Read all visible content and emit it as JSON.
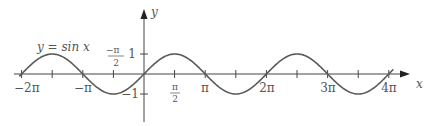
{
  "chart_data": {
    "type": "line",
    "title": "",
    "function_label": "y = sin x",
    "xlabel": "x",
    "ylabel": "y",
    "xlim": [
      -6.54,
      13.2
    ],
    "ylim": [
      -1.8,
      3.2
    ],
    "grid": false,
    "legend": null,
    "x_ticks": [
      {
        "value": -6.2832,
        "label": "−2π"
      },
      {
        "value": -4.7124,
        "label": ""
      },
      {
        "value": -3.1416,
        "label": "−π"
      },
      {
        "value": -1.5708,
        "label": "−π/2"
      },
      {
        "value": 0,
        "label": ""
      },
      {
        "value": 1.5708,
        "label": "π/2"
      },
      {
        "value": 3.1416,
        "label": "π"
      },
      {
        "value": 4.7124,
        "label": ""
      },
      {
        "value": 6.2832,
        "label": "2π"
      },
      {
        "value": 7.854,
        "label": ""
      },
      {
        "value": 9.4248,
        "label": "3π"
      },
      {
        "value": 10.9956,
        "label": ""
      },
      {
        "value": 12.5664,
        "label": "4π"
      }
    ],
    "y_ticks": [
      {
        "value": 1,
        "label": "1"
      },
      {
        "value": -1,
        "label": "−1"
      }
    ],
    "series": [
      {
        "name": "y = sin x",
        "x_range": [
          -6.4,
          12.8
        ],
        "expression": "sin(x)",
        "color": "#555555"
      }
    ],
    "key_points": [
      {
        "x": -6.2832,
        "y": 0
      },
      {
        "x": -4.7124,
        "y": 1
      },
      {
        "x": -3.1416,
        "y": 0
      },
      {
        "x": -1.5708,
        "y": -1
      },
      {
        "x": 0,
        "y": 0
      },
      {
        "x": 1.5708,
        "y": 1
      },
      {
        "x": 3.1416,
        "y": 0
      },
      {
        "x": 4.7124,
        "y": -1
      },
      {
        "x": 6.2832,
        "y": 0
      },
      {
        "x": 7.854,
        "y": 1
      },
      {
        "x": 9.4248,
        "y": 0
      },
      {
        "x": 10.9956,
        "y": -1
      },
      {
        "x": 12.5664,
        "y": 0
      }
    ]
  },
  "labels": {
    "function": "y = sin x",
    "x_axis": "x",
    "y_axis": "y",
    "neg_two_pi": "−2π",
    "neg_pi": "−π",
    "neg_half_pi_num": "−π",
    "half_den": "2",
    "half_pi_num": "π",
    "pi": "π",
    "two_pi": "2π",
    "three_pi": "3π",
    "four_pi": "4π",
    "y_one": "1",
    "y_neg_one": "−1"
  },
  "colors": {
    "axis": "#444444",
    "curve": "#5a5a5a",
    "text": "#555555"
  }
}
